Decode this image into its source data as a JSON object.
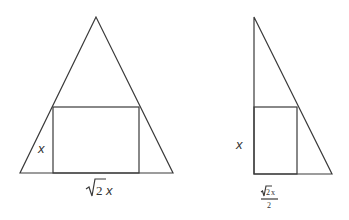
{
  "figures": [
    {
      "name": "isosceles-triangle-with-inscribed-rectangle",
      "triangle": {
        "apex": [
          96,
          17
        ],
        "base_left": [
          20,
          173
        ],
        "base_right": [
          173,
          173
        ]
      },
      "rectangle": {
        "x1": 53,
        "y1": 107,
        "x2": 139,
        "y2": 173
      },
      "labels": {
        "height": "x",
        "width_radical": "2",
        "width_var": "x"
      }
    },
    {
      "name": "right-triangle-with-inscribed-rectangle",
      "triangle": {
        "apex": [
          254,
          17
        ],
        "base_left": [
          254,
          174
        ],
        "base_right": [
          332,
          174
        ]
      },
      "rectangle": {
        "x1": 254,
        "y1": 107,
        "x2": 297,
        "y2": 174
      },
      "labels": {
        "height": "x",
        "width_num_radical": "2",
        "width_num_var": "x",
        "width_den": "2"
      }
    }
  ],
  "colors": {
    "line": "#3a3a3a",
    "text": "#333333",
    "background": "#ffffff"
  }
}
